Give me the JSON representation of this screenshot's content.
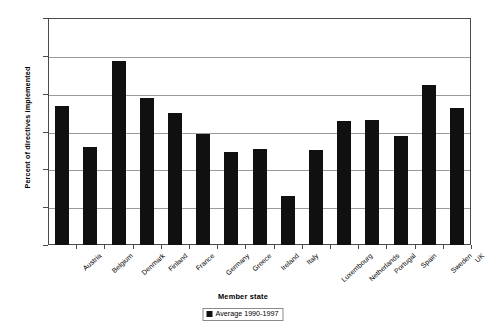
{
  "chart_data": {
    "type": "bar",
    "title": "",
    "xlabel": "Member state",
    "ylabel": "Percent of directives implemented",
    "ylim": [
      70,
      100
    ],
    "yticks": [
      70,
      75,
      80,
      85,
      90,
      95,
      100
    ],
    "grid": true,
    "legend_position": "bottom",
    "categories": [
      "Austria",
      "Belgium",
      "Denmark",
      "Finland",
      "France",
      "Germany",
      "Greece",
      "Ireland",
      "Italy",
      "Luxembourg",
      "Netherlands",
      "Portugal",
      "Spain",
      "Sweden",
      "UK"
    ],
    "series": [
      {
        "name": "Average 1990-1997",
        "color": "#101010",
        "values": [
          88.4,
          83.0,
          94.3,
          89.4,
          87.4,
          84.7,
          82.3,
          82.7,
          76.5,
          82.6,
          86.4,
          86.5,
          84.4,
          91.1,
          88.1
        ]
      }
    ]
  },
  "legend": {
    "entries": [
      {
        "label": "Average 1990-1997",
        "swatch_name": "legend-swatch-average"
      }
    ]
  },
  "axes": {
    "y_title": "Percent of directives implemented",
    "x_title": "Member state",
    "y_tick_labels": [
      "100",
      "95",
      "90",
      "85",
      "80",
      "75",
      "70"
    ]
  }
}
